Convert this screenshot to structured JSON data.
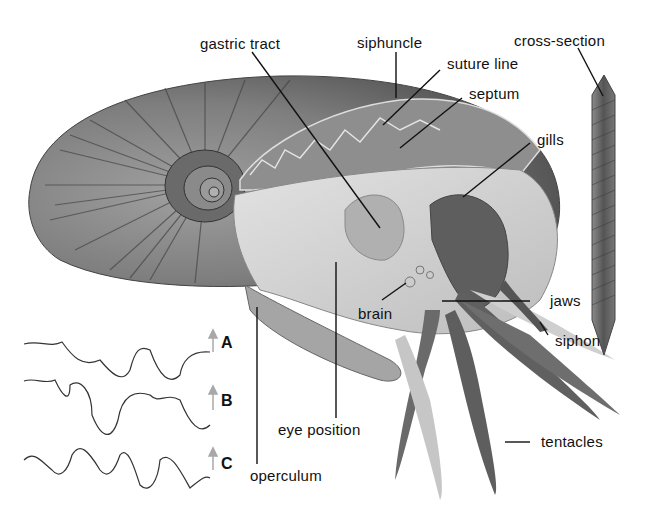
{
  "diagram": {
    "labels": {
      "gastric_tract": "gastric tract",
      "siphuncle": "siphuncle",
      "suture_line": "suture line",
      "septum": "septum",
      "cross_section": "cross-section",
      "gills": "gills",
      "jaws": "jaws",
      "brain": "brain",
      "siphon": "siphon",
      "eye_position": "eye position",
      "tentacles": "tentacles",
      "operculum": "operculum"
    },
    "suture_types": [
      {
        "letter": "A"
      },
      {
        "letter": "B"
      },
      {
        "letter": "C"
      }
    ],
    "colors": {
      "shell_dark": "#5a5a5a",
      "shell_mid": "#8a8a8a",
      "body_light": "#d4d4d4",
      "tentacle_dark": "#5c5c5c",
      "tentacle_light": "#c8c8c8",
      "arrow_gray": "#a8a8a8",
      "text": "#111111"
    }
  }
}
